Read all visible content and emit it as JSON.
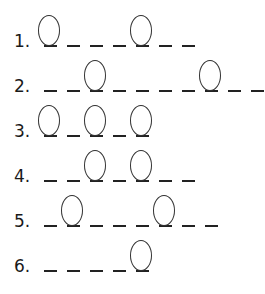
{
  "worksheet": {
    "rows": [
      {
        "label": "1.",
        "slots": [
          true,
          false,
          false,
          false,
          true,
          false,
          false
        ]
      },
      {
        "label": "2.",
        "slots": [
          false,
          false,
          true,
          false,
          false,
          false,
          false,
          true,
          false,
          false
        ]
      },
      {
        "label": "3.",
        "slots": [
          true,
          false,
          true,
          false,
          true
        ]
      },
      {
        "label": "4.",
        "slots": [
          false,
          false,
          true,
          false,
          true,
          false,
          false
        ]
      },
      {
        "label": "5.",
        "slots": [
          false,
          true,
          false,
          false,
          false,
          true,
          false,
          false
        ]
      },
      {
        "label": "6.",
        "slots": [
          false,
          false,
          false,
          false,
          true
        ]
      }
    ]
  },
  "layout": {
    "dash_start_x": 44,
    "dash_spacing": 23,
    "row_baselines": [
      47,
      92,
      137,
      182,
      227,
      272
    ]
  }
}
